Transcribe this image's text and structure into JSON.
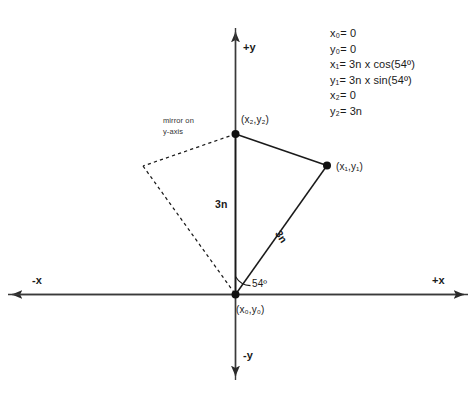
{
  "figure": {
    "title_fragment": "",
    "axes": {
      "positive_y": "+y",
      "negative_y": "-y",
      "positive_x": "+x",
      "negative_x": "-x"
    },
    "points": {
      "origin_label": "(x₀,y₀)",
      "vertex1_label": "(x₁,y₁)",
      "vertex2_label": "(x₂,y₂)"
    },
    "annotations": {
      "mirror_line1": "mirror on",
      "mirror_line2": "y-axis",
      "length_vertical": "3n",
      "length_diagonal": "3n",
      "angle": "54º"
    },
    "equations": [
      "x₀= 0",
      "y₀= 0",
      "x₁= 3n x cos(54º)",
      "y₁= 3n x sin(54º)",
      "x₂= 0",
      "y₂= 3n"
    ],
    "colors": {
      "stroke": "#1a1a1a",
      "axis": "#3a3a3a",
      "text": "#1a1a1a",
      "background": "#ffffff"
    }
  }
}
